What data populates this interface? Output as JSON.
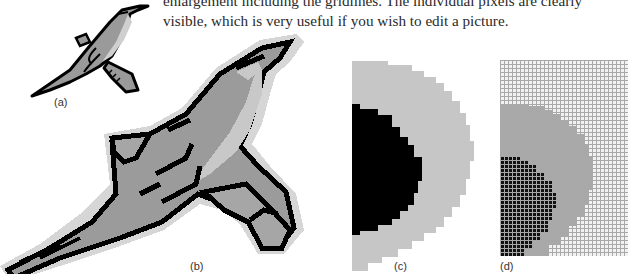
{
  "text": {
    "lines": [
      "enlargement including the gridlines. The individual pixels are clearly",
      "visible, which is very useful if you wish to edit a picture."
    ]
  },
  "figures": [
    {
      "id": "a",
      "label": "(a)",
      "description": "original bird clip-art image"
    },
    {
      "id": "b",
      "label": "(b)",
      "description": "enlarged bird showing individual pixels"
    },
    {
      "id": "c",
      "label": "(c)",
      "description": "further enlargement of eye region"
    },
    {
      "id": "d",
      "label": "(d)",
      "description": "enlargement including the gridlines"
    }
  ],
  "colors": {
    "outline": "#000000",
    "dark_gray": "#8c8c8c",
    "mid_gray": "#a6a6a6",
    "light_gray": "#c8c8c8",
    "halo": "#d6d6d6",
    "grid": "#bdbdbd"
  }
}
